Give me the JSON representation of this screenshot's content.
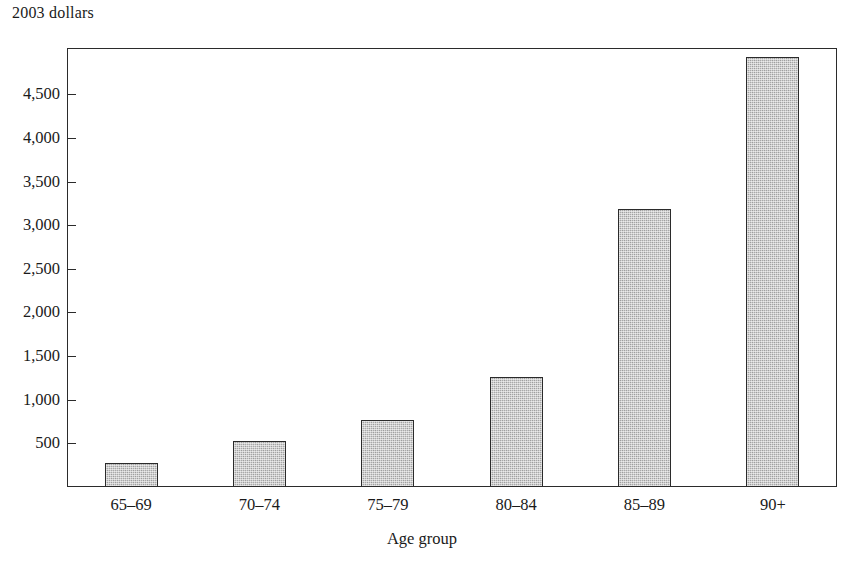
{
  "chart_data": {
    "type": "bar",
    "title": "",
    "ylabel": "2003 dollars",
    "xlabel": "Age group",
    "categories": [
      "65–69",
      "70–74",
      "75–79",
      "80–84",
      "85–89",
      "90+"
    ],
    "values": [
      280,
      530,
      770,
      1260,
      3180,
      4930
    ],
    "series": [
      {
        "name": "2003 dollars",
        "values": [
          280,
          530,
          770,
          1260,
          3180,
          4930
        ]
      }
    ],
    "ylim": [
      0,
      5030
    ],
    "ytick_values": [
      500,
      1000,
      1500,
      2000,
      2500,
      3000,
      3500,
      4000,
      4500
    ],
    "ytick_labels": [
      "500",
      "1,000",
      "1,500",
      "2,000",
      "2,500",
      "3,000",
      "3,500",
      "4,000",
      "4,500"
    ],
    "grid": false,
    "legend": "none",
    "bar_fill_color": "#a9a9a9",
    "bar_border_color": "#2b2b2b",
    "axis_color": "#2b2b2b",
    "background_color": "#ffffff"
  }
}
